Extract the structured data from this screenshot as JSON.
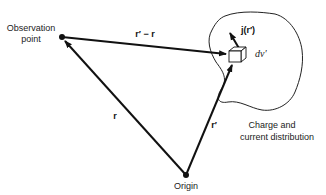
{
  "diagram": {
    "title": "",
    "labels": {
      "observation_point_line1": "Observation",
      "observation_point_line2": "point",
      "origin": "Origin",
      "distribution_line1": "Charge and",
      "distribution_line2": "current distribution",
      "vector_r": "r",
      "vector_r_prime": "r′",
      "vector_difference": "r′ − r",
      "current_density": "j(r′)",
      "volume_element": "dv′"
    },
    "points": {
      "observation_point": [
        62,
        37
      ],
      "origin": [
        186,
        175
      ],
      "volume_element": [
        237,
        55
      ]
    },
    "colors": {
      "stroke": "#111111",
      "text": "#222222",
      "background": "#ffffff"
    }
  }
}
